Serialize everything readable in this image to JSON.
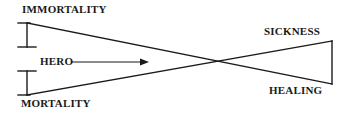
{
  "diagram": {
    "type": "bowtie-crossing-lines",
    "background_color": "#ffffff",
    "stroke_color": "#1a1a1a",
    "labels": {
      "immortality": "IMMORTALITY",
      "mortality": "MORTALITY",
      "sickness": "SICKNESS",
      "healing": "HEALING",
      "hero": "HERO"
    },
    "arrow": {
      "name": "hero-arrow",
      "direction": "right",
      "from_x": 72,
      "to_x": 148,
      "y": 62
    },
    "lines": [
      {
        "name": "immortality-to-healing",
        "from": {
          "x": 27,
          "y": 23
        },
        "to": {
          "x": 332,
          "y": 84
        }
      },
      {
        "name": "mortality-to-sickness",
        "from": {
          "x": 27,
          "y": 95
        },
        "to": {
          "x": 332,
          "y": 41
        }
      }
    ],
    "crossing_point": {
      "x": 228,
      "y": 58
    },
    "brackets": [
      {
        "name": "immortality-bracket",
        "x": 27,
        "top_y": 23,
        "bottom_y": 47,
        "cap_width": 18
      },
      {
        "name": "mortality-bracket",
        "x": 27,
        "top_y": 71,
        "bottom_y": 95,
        "cap_width": 18
      }
    ],
    "right_edge": {
      "name": "right-vertical-edge",
      "x": 332,
      "top_y": 41,
      "bottom_y": 84
    }
  }
}
